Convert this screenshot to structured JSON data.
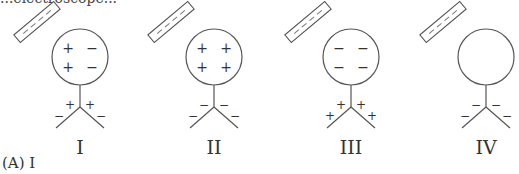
{
  "question": {
    "top_text_partial": "...electroscope...",
    "answer_choice_visible": "(A) I"
  },
  "diagrams": [
    {
      "label": "I",
      "rod_charge": "negative",
      "sphere_charges": [
        "+",
        "−",
        "+",
        "−"
      ],
      "leaf_charges": [
        "+",
        "+",
        "−",
        "−"
      ]
    },
    {
      "label": "II",
      "rod_charge": "negative",
      "sphere_charges": [
        "+",
        "+",
        "+",
        "+"
      ],
      "leaf_charges": [
        "−",
        "−",
        "−",
        "−"
      ]
    },
    {
      "label": "III",
      "rod_charge": "negative",
      "sphere_charges": [
        "−",
        "−",
        "−",
        "−"
      ],
      "leaf_charges": [
        "+",
        "+",
        "+",
        "+"
      ]
    },
    {
      "label": "IV",
      "rod_charge": "negative",
      "sphere_charges": [],
      "leaf_charges": [
        "−",
        "−",
        "−",
        "−"
      ]
    }
  ]
}
